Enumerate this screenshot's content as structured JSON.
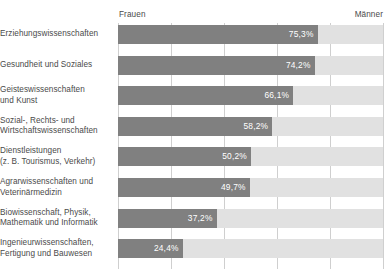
{
  "chart_data": {
    "type": "bar",
    "orientation": "horizontal",
    "title": "",
    "subtitle": "",
    "xlabel": "",
    "ylabel": "",
    "xlim": [
      0,
      100
    ],
    "grid": true,
    "gridline_values": [
      0,
      20,
      40,
      60,
      80,
      100
    ],
    "legend_position": "top",
    "legend": [
      "Frauen",
      "Männer"
    ],
    "value_suffix": "%",
    "decimal_separator": ",",
    "categories": [
      "Erziehungswissenschaften",
      "Gesundheit und Soziales",
      "Geisteswissenschaften und Kunst",
      "Sozial-, Rechts- und Wirtschaftswissenschaften",
      "Dienstleistungen (z. B. Tourismus, Verkehr)",
      "Agrarwissenschaften und Veterinärmedizin",
      "Biowissenschaft, Physik, Mathematik und Informatik",
      "Ingenieurwissenschaften, Fertigung und Bauwesen"
    ],
    "series": [
      {
        "name": "Frauen",
        "color": "#808080",
        "values": [
          75.3,
          74.2,
          66.1,
          58.2,
          50.2,
          49.7,
          37.2,
          24.4
        ]
      },
      {
        "name": "Männer",
        "color": "#e1e1e1",
        "values": [
          24.7,
          25.8,
          33.9,
          41.8,
          49.8,
          50.3,
          62.8,
          75.6
        ]
      }
    ]
  },
  "header": {
    "left_caption": "Frauen",
    "right_caption": "Männer"
  },
  "rows": [
    {
      "label_lines": [
        "Erziehungswissenschaften"
      ],
      "value": 75.3,
      "value_text": "75,3%"
    },
    {
      "label_lines": [
        "Gesundheit und Soziales"
      ],
      "value": 74.2,
      "value_text": "74,2%"
    },
    {
      "label_lines": [
        "Geisteswissenschaften",
        "und Kunst"
      ],
      "value": 66.1,
      "value_text": "66,1%"
    },
    {
      "label_lines": [
        "Sozial-, Rechts- und",
        "Wirtschaftswissenschaften"
      ],
      "value": 58.2,
      "value_text": "58,2%"
    },
    {
      "label_lines": [
        "Dienstleistungen",
        "(z. B. Tourismus, Verkehr)"
      ],
      "value": 50.2,
      "value_text": "50,2%"
    },
    {
      "label_lines": [
        "Agrarwissenschaften und",
        "Veterinärmedizin"
      ],
      "value": 49.7,
      "value_text": "49,7%"
    },
    {
      "label_lines": [
        "Biowissenschaft, Physik,",
        "Mathematik und Informatik"
      ],
      "value": 37.2,
      "value_text": "37,2%"
    },
    {
      "label_lines": [
        "Ingenieurwissenschaften,",
        "Fertigung und Bauwesen"
      ],
      "value": 24.4,
      "value_text": "24,4%"
    }
  ],
  "colors": {
    "bar_women": "#808080",
    "bar_men": "#e1e1e1",
    "gridline": "#cfcfcf",
    "text": "#4a4a4a",
    "value_text": "#ffffff",
    "background": "#ffffff"
  }
}
